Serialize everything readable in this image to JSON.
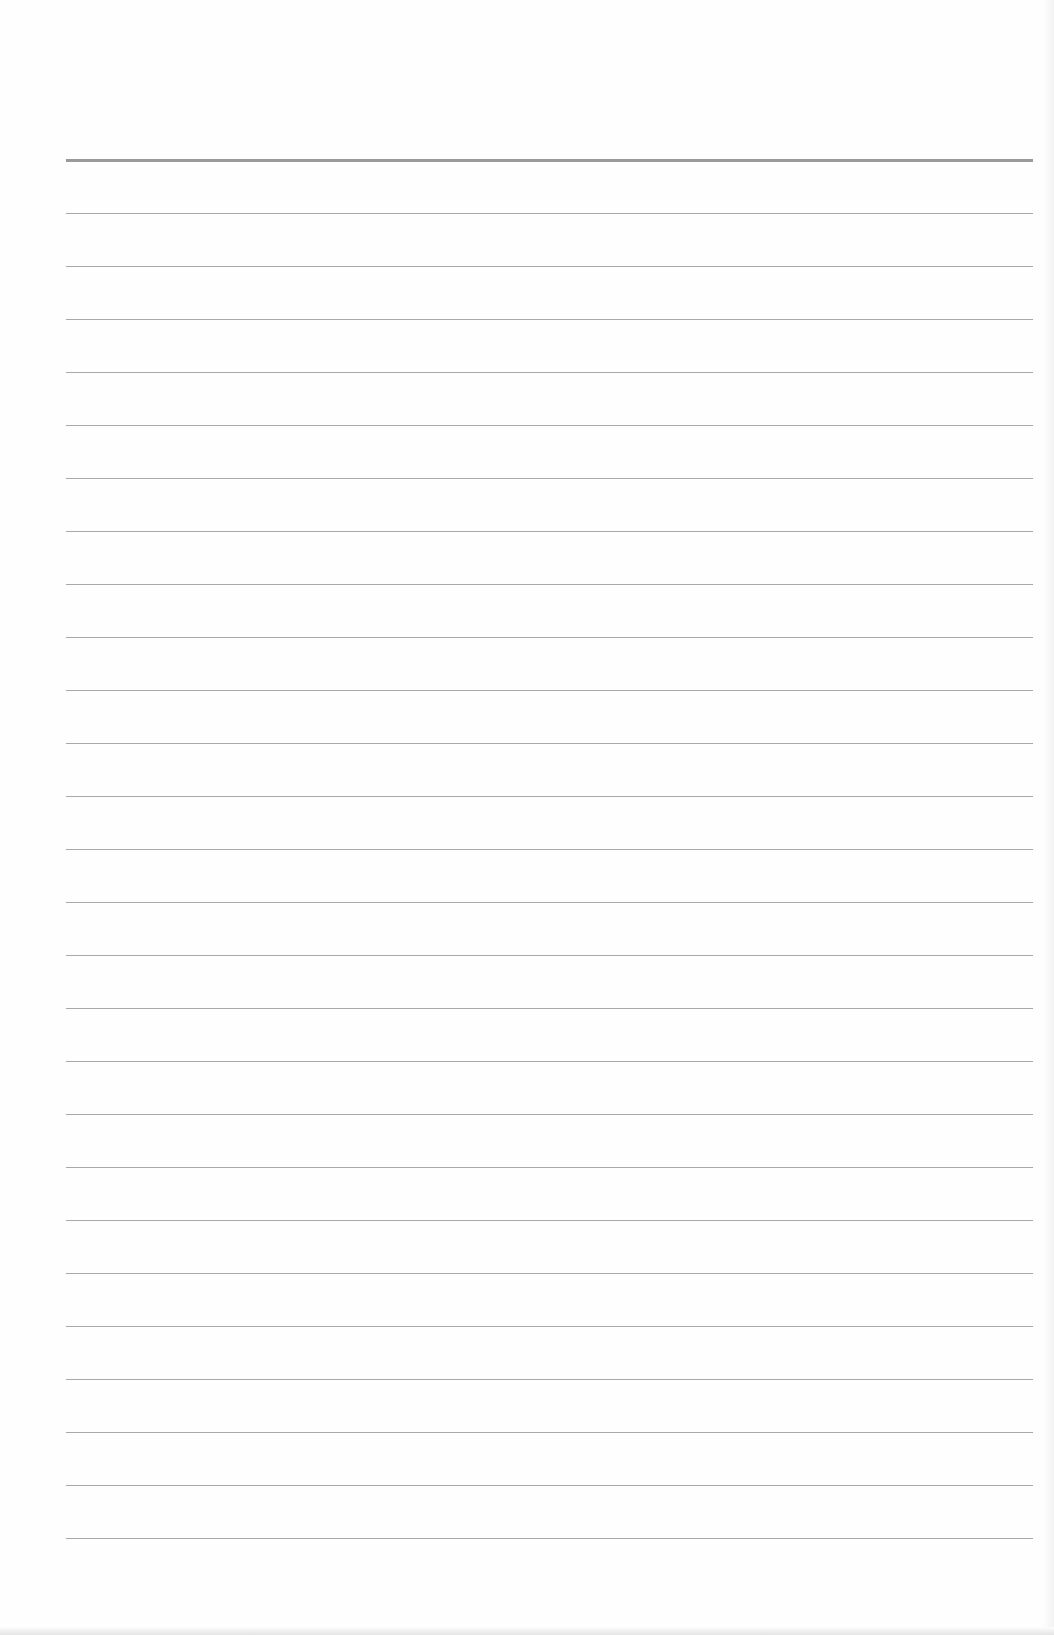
{
  "document": {
    "type": "blank-lined-paper",
    "header_rule": {
      "y": 159,
      "thickness": 3,
      "color": "#9a9a9a"
    },
    "rules": {
      "count": 26,
      "first_y": 213,
      "spacing": 53,
      "left": 66,
      "right": 1033,
      "color": "#a8a8a8"
    },
    "text": []
  }
}
